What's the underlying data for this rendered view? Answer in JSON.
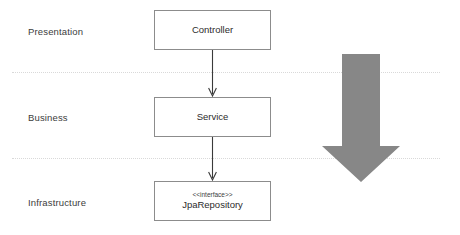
{
  "diagram": {
    "background_color": "#ffffff",
    "layers": [
      {
        "label": "Presentation"
      },
      {
        "label": "Business"
      },
      {
        "label": "Infrastructure"
      }
    ],
    "components": [
      {
        "name": "Controller",
        "stereotype": "",
        "layer": "Presentation"
      },
      {
        "name": "Service",
        "stereotype": "",
        "layer": "Business"
      },
      {
        "name": "JpaRepository",
        "stereotype": "<<interface>>",
        "layer": "Infrastructure"
      }
    ],
    "connectors": [
      {
        "from": "Controller",
        "to": "Service",
        "style": "solid-open-arrow"
      },
      {
        "from": "Service",
        "to": "JpaRepository",
        "style": "solid-open-arrow"
      }
    ],
    "flow_arrow": {
      "direction": "down",
      "color": "#878787",
      "meaning": "dependency direction"
    },
    "colors": {
      "box_border": "#8c8c8c",
      "box_fill": "#ffffff",
      "divider": "#d9d9d9",
      "connector": "#3a3a3a",
      "text": "#2b2b2b"
    }
  }
}
